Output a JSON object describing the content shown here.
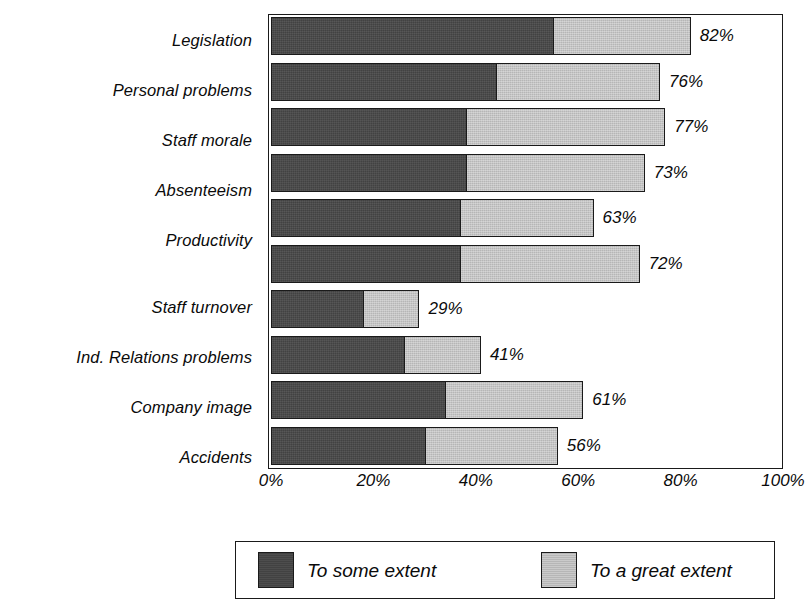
{
  "chart_data": {
    "type": "bar",
    "subtype": "horizontal-stacked",
    "title": "",
    "subtitle": "",
    "xlabel": "",
    "ylabel": "",
    "xlim": [
      0,
      100
    ],
    "grid": false,
    "legend_position": "bottom",
    "categories": [
      "Legislation",
      "Personal problems",
      "Staff morale",
      "Absenteeism",
      "Productivity",
      "Staff turnover",
      "Ind. Relations problems",
      "Company image",
      "Accidents"
    ],
    "series": [
      {
        "name": "To some extent",
        "color": "#424242",
        "values": [
          55,
          44,
          38,
          38,
          37,
          18,
          26,
          34,
          30
        ]
      },
      {
        "name": "To a great extent",
        "color": "#b6b6b6",
        "values": [
          27,
          32,
          39,
          35,
          26,
          11,
          15,
          27,
          26
        ]
      }
    ],
    "totals": [
      82,
      76,
      77,
      73,
      63,
      72,
      29,
      41,
      61,
      56
    ],
    "bars": [
      {
        "category": "Legislation",
        "some": 55,
        "great": 27,
        "total": 82,
        "total_label": "82%"
      },
      {
        "category": "Personal problems",
        "some": 44,
        "great": 32,
        "total": 76,
        "total_label": "76%"
      },
      {
        "category": "Staff morale",
        "some": 38,
        "great": 39,
        "total": 77,
        "total_label": "77%"
      },
      {
        "category": "Absenteeism",
        "some": 38,
        "great": 35,
        "total": 73,
        "total_label": "73%"
      },
      {
        "category": "Productivity",
        "some": 37,
        "great": 26,
        "total": 63,
        "total_label": "63%"
      },
      {
        "category": "Staff turnover",
        "some": 37,
        "great": 35,
        "total": 72,
        "total_label": "72%"
      },
      {
        "category": "Ind. Relations problems",
        "some": 18,
        "great": 11,
        "total": 29,
        "total_label": "29%"
      },
      {
        "category": "Company image",
        "some": 26,
        "great": 15,
        "total": 41,
        "total_label": "41%"
      },
      {
        "category": "Accidents",
        "some": 34,
        "great": 27,
        "total": 61,
        "total_label": "61%"
      },
      {
        "category": "",
        "some": 30,
        "great": 26,
        "total": 56,
        "total_label": "56%"
      }
    ],
    "x_ticks": [
      {
        "value": 0,
        "label": "0%"
      },
      {
        "value": 20,
        "label": "20%"
      },
      {
        "value": 40,
        "label": "40%"
      },
      {
        "value": 60,
        "label": "60%"
      },
      {
        "value": 80,
        "label": "80%"
      },
      {
        "value": 100,
        "label": "100%"
      }
    ],
    "legend": [
      {
        "label": "To some extent",
        "color": "#424242"
      },
      {
        "label": "To a great extent",
        "color": "#b6b6b6"
      }
    ]
  },
  "categories": {
    "c0": "Legislation",
    "c1": "Personal problems",
    "c2": "Staff morale",
    "c3": "Absenteeism",
    "c4": "Productivity",
    "c5": "Staff turnover",
    "c6": "Ind. Relations problems",
    "c7": "Company image",
    "c8": "Accidents"
  },
  "legend": {
    "some_label": "To some extent",
    "great_label": "To a great extent"
  },
  "colors": {
    "some_extent": "#424242",
    "great_extent": "#b6b6b6",
    "outline": "#1a1a1a",
    "background": "#ffffff"
  }
}
